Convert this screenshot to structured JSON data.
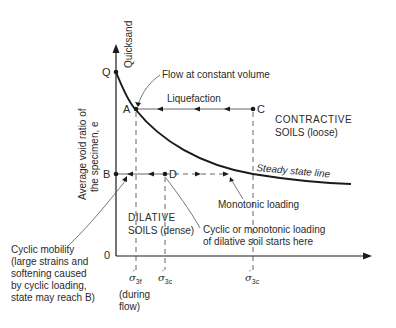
{
  "diagram": {
    "type": "state-diagram",
    "y_axis_label_line1": "Average void ratio of",
    "y_axis_label_line2": "the specimen, e",
    "y_axis_top_label": "Quicksand",
    "origin_label": "0",
    "points": {
      "Q": "Q",
      "A": "A",
      "B": "B",
      "C": "C",
      "D": "D"
    },
    "annotations": {
      "flow": "Flow at constant volume",
      "liquefaction": "Liquefaction",
      "contractive_1": "CONTRACTIVE",
      "contractive_2": "SOILS (loose)",
      "steady_state": "Steady state line",
      "monotonic": "Monotonic loading",
      "dilative_1": "DILATIVE",
      "dilative_2_a": "SOILS",
      "dilative_2_b": "(dense)",
      "cyclic_start_1": "Cyclic or monotonic loading",
      "cyclic_start_2": "of dilative soil starts here",
      "cyclic_mobility_1": "Cyclic mobility",
      "cyclic_mobility_2": "(large strains and",
      "cyclic_mobility_3": "softening caused",
      "cyclic_mobility_4": "by cyclic loading,",
      "cyclic_mobility_5": "state may reach B)"
    },
    "x_ticks": {
      "sigma_3f": {
        "symbol": "σ",
        "prime": "′",
        "sub": "3f",
        "note_1": "(during",
        "note_2": "flow)"
      },
      "sigma_3c_1": {
        "symbol": "σ",
        "prime": "′",
        "sub": "3c"
      },
      "sigma_3c_2": {
        "symbol": "σ",
        "prime": "′",
        "sub": "3c"
      }
    },
    "colors": {
      "line": "#1a1a1a",
      "dashed": "#555555",
      "text": "#2a2a2a"
    }
  }
}
